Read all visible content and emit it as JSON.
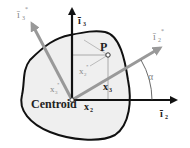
{
  "diagram": {
    "labels": {
      "point": "P",
      "centroid": "Centroid",
      "axis_i2": "ī",
      "axis_i2_sub": "2",
      "axis_i3": "ī",
      "axis_i3_sub": "3",
      "axis_i2_star": "ī",
      "axis_i2_star_sub": "2",
      "axis_i3_star": "ī",
      "axis_i3_star_sub": "3",
      "star": "*",
      "x2": "x",
      "x2_sub": "2",
      "x3": "x",
      "x3_sub": "3",
      "x2_star": "x",
      "x2_star_sub": "2",
      "x3_star": "x",
      "x3_star_sub": "3",
      "angle": "α"
    },
    "colors": {
      "outline": "#111111",
      "fill": "#efefef",
      "rotated_axes": "#999999",
      "thin_lines": "#aaaaaa"
    }
  }
}
